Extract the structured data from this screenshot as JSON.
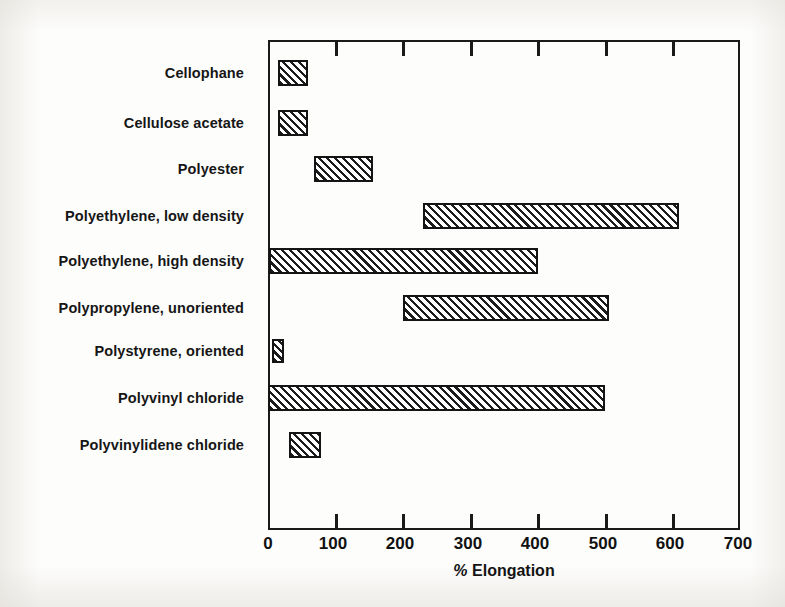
{
  "figure": {
    "background_color": "#fdfdfc",
    "ink_color": "#1a1a1a"
  },
  "chart_data": {
    "type": "bar",
    "orientation": "horizontal",
    "subtype": "range-bar",
    "title": "",
    "xlabel": "% Elongation",
    "ylabel": "",
    "xlim": [
      0,
      700
    ],
    "ylim": null,
    "grid": false,
    "legend": null,
    "xticks": [
      0,
      100,
      200,
      300,
      400,
      500,
      600,
      700
    ],
    "xticklabels": [
      "0",
      "100",
      "200",
      "300",
      "400",
      "500",
      "600",
      "700"
    ],
    "categories": [
      "Cellophane",
      "Cellulose acetate",
      "Polyester",
      "Polyethylene, low density",
      "Polyethylene, high density",
      "Polypropylene, unoriented",
      "Polystyrene, oriented",
      "Polyvinyl chloride",
      "Polyvinylidene chloride"
    ],
    "bars": [
      {
        "category": "Cellophane",
        "start": 15,
        "end": 60,
        "label": "15–60"
      },
      {
        "category": "Cellulose acetate",
        "start": 15,
        "end": 60,
        "label": "15–60"
      },
      {
        "category": "Polyester",
        "start": 68,
        "end": 155,
        "label": "68–155"
      },
      {
        "category": "Polyethylene, low density",
        "start": 230,
        "end": 610,
        "label": "230–610"
      },
      {
        "category": "Polyethylene, high density",
        "start": 2,
        "end": 400,
        "label": "2–400"
      },
      {
        "category": "Polypropylene, unoriented",
        "start": 200,
        "end": 505,
        "label": "200–505"
      },
      {
        "category": "Polystyrene, oriented",
        "start": 6,
        "end": 24,
        "label": "6–24"
      },
      {
        "category": "Polyvinyl chloride",
        "start": 0,
        "end": 500,
        "label": "0–500"
      },
      {
        "category": "Polyvinylidene chloride",
        "start": 31,
        "end": 78,
        "label": "31–78"
      }
    ]
  }
}
